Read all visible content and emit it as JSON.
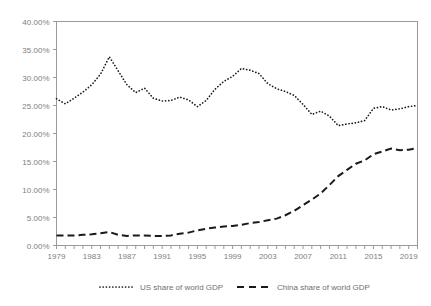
{
  "chart_data": {
    "type": "line",
    "title": "",
    "xlabel": "",
    "ylabel": "",
    "xlim": [
      1979,
      2020
    ],
    "ylim": [
      0,
      40
    ],
    "grid": false,
    "legend_position": "bottom",
    "y_tick_labels": [
      "40.00%",
      "35.00%",
      "30.00%",
      "25.00%",
      "20.00%",
      "15.00%",
      "10.00%",
      "5.00%",
      "0.00%"
    ],
    "y_tick_values": [
      40,
      35,
      30,
      25,
      20,
      15,
      10,
      5,
      0
    ],
    "x_tick_labels": [
      "1979",
      "1983",
      "1987",
      "1991",
      "1995",
      "1999",
      "2003",
      "2007",
      "2011",
      "2015",
      "2019"
    ],
    "x_tick_values": [
      1979,
      1983,
      1987,
      1991,
      1995,
      1999,
      2003,
      2007,
      2011,
      2015,
      2019
    ],
    "x": [
      1979,
      1980,
      1981,
      1982,
      1983,
      1984,
      1985,
      1986,
      1987,
      1988,
      1989,
      1990,
      1991,
      1992,
      1993,
      1994,
      1995,
      1996,
      1997,
      1998,
      1999,
      2000,
      2001,
      2002,
      2003,
      2004,
      2005,
      2006,
      2007,
      2008,
      2009,
      2010,
      2011,
      2012,
      2013,
      2014,
      2015,
      2016,
      2017,
      2018,
      2019,
      2020
    ],
    "series": [
      {
        "name": "US share of world GDP",
        "style": "dotted",
        "color": "#1a1a1a",
        "values": [
          26.2,
          25.3,
          26.3,
          27.4,
          28.7,
          30.6,
          33.7,
          31.2,
          28.7,
          27.3,
          28.1,
          26.3,
          25.8,
          25.9,
          26.5,
          26.0,
          24.8,
          25.9,
          27.9,
          29.3,
          30.2,
          31.6,
          31.3,
          30.7,
          28.9,
          28.0,
          27.5,
          26.8,
          25.2,
          23.4,
          24.0,
          23.1,
          21.4,
          21.7,
          21.9,
          22.3,
          24.5,
          24.8,
          24.2,
          24.4,
          24.8,
          25.0
        ]
      },
      {
        "name": "China share of world GDP",
        "style": "dashed",
        "color": "#1a1a1a",
        "values": [
          1.8,
          1.8,
          1.8,
          1.9,
          2.0,
          2.2,
          2.4,
          1.9,
          1.7,
          1.8,
          1.8,
          1.7,
          1.7,
          1.8,
          2.1,
          2.3,
          2.7,
          3.0,
          3.2,
          3.4,
          3.5,
          3.7,
          4.0,
          4.2,
          4.5,
          4.8,
          5.4,
          6.2,
          7.2,
          8.2,
          9.3,
          10.8,
          12.4,
          13.5,
          14.6,
          15.2,
          16.3,
          16.8,
          17.3,
          17.0,
          17.1,
          17.4
        ]
      }
    ]
  },
  "legend": {
    "items": [
      {
        "label": "US share of world GDP"
      },
      {
        "label": "China share of world GDP"
      }
    ]
  }
}
